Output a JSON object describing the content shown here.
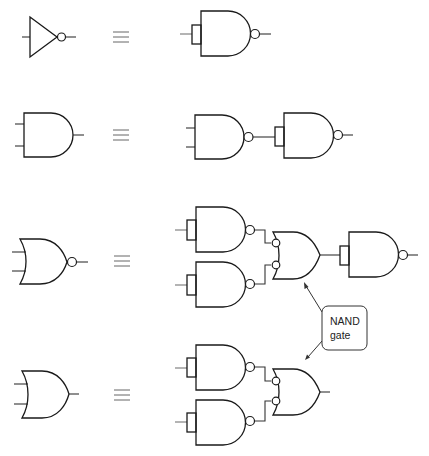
{
  "diagram": {
    "equivalence_symbol": "≡",
    "rows": [
      {
        "id": "row-not",
        "left_gate": "NOT",
        "right_gates": [
          "NAND (inputs tied)"
        ]
      },
      {
        "id": "row-and",
        "left_gate": "AND",
        "right_gates": [
          "NAND",
          "NAND (inputs tied)"
        ]
      },
      {
        "id": "row-nor",
        "left_gate": "NOR",
        "right_gates": [
          "NAND (inputs tied)",
          "NAND (inputs tied)",
          "OR with inverted inputs (NAND)",
          "NAND (inputs tied)"
        ]
      },
      {
        "id": "row-or",
        "left_gate": "OR",
        "right_gates": [
          "NAND (inputs tied)",
          "NAND (inputs tied)",
          "OR with inverted inputs (NAND)"
        ]
      }
    ],
    "callout": {
      "line1": "NAND",
      "line2": "gate"
    },
    "colors": {
      "stroke": "#1a1a1a",
      "background": "#ffffff"
    }
  }
}
